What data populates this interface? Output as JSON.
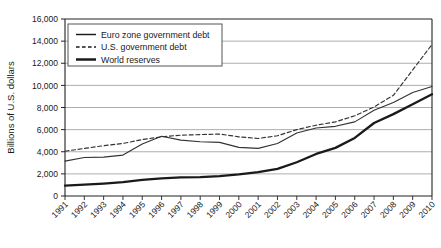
{
  "chart_data": {
    "type": "line",
    "title": "",
    "xlabel": "",
    "ylabel": "Billions of U.S. dollars",
    "ylim": [
      0,
      16000
    ],
    "ytick_labels": [
      "16,000",
      "14,000",
      "12,000",
      "10,000",
      "8,000",
      "6,000",
      "4,000",
      "2,000",
      "0"
    ],
    "ytick_values": [
      16000,
      14000,
      12000,
      10000,
      8000,
      6000,
      4000,
      2000,
      0
    ],
    "grid": true,
    "legend_position": "top-left",
    "categories": [
      "1991",
      "1992",
      "1993",
      "1994",
      "1995",
      "1996",
      "1997",
      "1998",
      "1999",
      "2000",
      "2001",
      "2002",
      "2003",
      "2004",
      "2005",
      "2006",
      "2007",
      "2008",
      "2009",
      "2010"
    ],
    "series": [
      {
        "name": "Euro zone government debt",
        "style": "solid-thin",
        "color": "#333333",
        "values": [
          3150,
          3480,
          3520,
          3700,
          4700,
          5400,
          5050,
          4900,
          4850,
          4400,
          4300,
          4750,
          5700,
          6150,
          6300,
          6700,
          7750,
          8450,
          9350,
          9900
        ]
      },
      {
        "name": "U.S. government debt",
        "style": "dashed",
        "color": "#333333",
        "values": [
          4050,
          4300,
          4550,
          4750,
          5100,
          5350,
          5500,
          5550,
          5600,
          5350,
          5200,
          5450,
          6000,
          6400,
          6700,
          7250,
          8050,
          9100,
          11400,
          13700
        ]
      },
      {
        "name": "World reserves",
        "style": "solid-thick",
        "color": "#1a1a1a",
        "values": [
          930,
          1020,
          1120,
          1250,
          1450,
          1600,
          1680,
          1700,
          1800,
          1950,
          2150,
          2450,
          3050,
          3800,
          4350,
          5250,
          6600,
          7400,
          8300,
          9200
        ]
      }
    ]
  },
  "legend": {
    "items": [
      {
        "label": "Euro zone government debt",
        "style": "solid-thin"
      },
      {
        "label": "U.S. government debt",
        "style": "dashed"
      },
      {
        "label": "World reserves",
        "style": "solid-thick"
      }
    ]
  }
}
